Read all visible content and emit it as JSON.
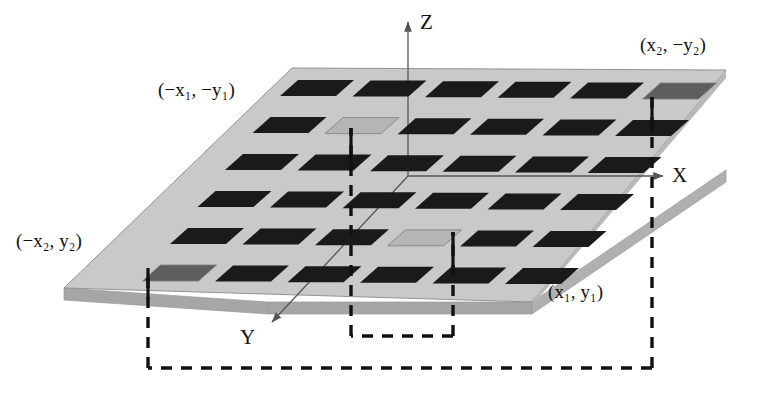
{
  "figure": {
    "kind": "3d-patch-antenna-array-diagram"
  },
  "axes": {
    "z_label": "Z",
    "x_label": "X",
    "y_label": "Y"
  },
  "corner_labels": [
    {
      "id": "neg-x1-neg-y1",
      "text": "(−x₁, −y₁)",
      "x": 158,
      "y": 79
    },
    {
      "id": "x2-neg-y2",
      "text": "(x₂, −y₂)",
      "x": 640,
      "y": 34
    },
    {
      "id": "neg-x2-y2",
      "text": "(−x₂, y₂)",
      "x": 16,
      "y": 230
    },
    {
      "id": "x1-y1",
      "text": "(x₁, y₁)",
      "x": 548,
      "y": 281
    }
  ],
  "array": {
    "rows": 6,
    "cols": 6,
    "total_patches": 36,
    "patch_fill_default": "#1a1a1a",
    "patch_fill_highlight_light": "#b5b5b5",
    "patch_fill_highlight_dark": "#5e5e5e",
    "highlighted": [
      {
        "row": 1,
        "col": 6,
        "shade": "dark",
        "coordinate": "(x₂, −y₂)"
      },
      {
        "row": 2,
        "col": 2,
        "shade": "light",
        "coordinate": "(−x₁, −y₁)"
      },
      {
        "row": 5,
        "col": 4,
        "shade": "light",
        "coordinate": "(x₁, y₁)"
      },
      {
        "row": 6,
        "col": 1,
        "shade": "dark",
        "coordinate": "(−x₂, y₂)"
      }
    ]
  },
  "substrate": {
    "top_fill": "#c9c9c9",
    "side_fill": "#a6a6a6",
    "edge_stroke": "#8a8a8a"
  },
  "colors": {
    "ink": "#111111",
    "axis_stroke": "#555555",
    "dash_stroke": "#111111",
    "background": "#ffffff"
  }
}
